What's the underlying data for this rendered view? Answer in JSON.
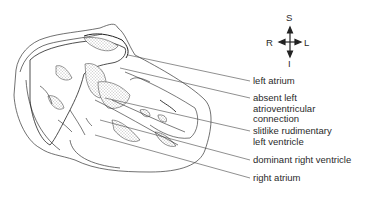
{
  "diagram": {
    "type": "anatomical-heart-section",
    "compass": {
      "superior": "S",
      "inferior": "I",
      "right": "R",
      "left": "L"
    },
    "labels": [
      {
        "id": "left-atrium",
        "text": "left atrium"
      },
      {
        "id": "absent-left-av-connection",
        "text": "absent left\natrioventricular\nconnection"
      },
      {
        "id": "slitlike-rudimentary-lv",
        "text": "slitlike rudimentary\nleft ventricle"
      },
      {
        "id": "dominant-rv",
        "text": "dominant right ventricle"
      },
      {
        "id": "right-atrium",
        "text": "right atrium"
      }
    ]
  }
}
